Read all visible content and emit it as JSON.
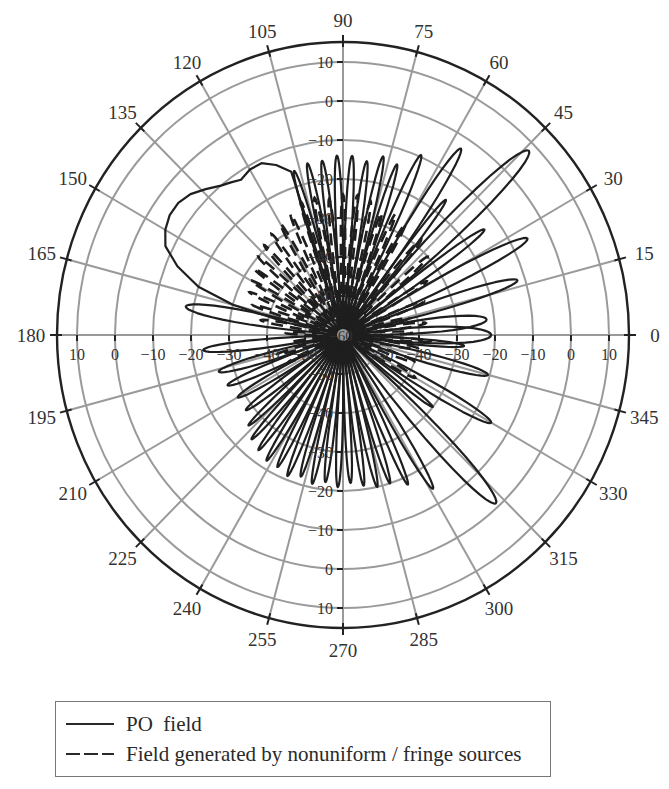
{
  "chart_data": {
    "type": "polar",
    "title": "",
    "angular_axis": {
      "unit": "deg",
      "ticks": [
        0,
        15,
        30,
        45,
        60,
        75,
        90,
        105,
        120,
        135,
        150,
        165,
        180,
        195,
        210,
        225,
        240,
        255,
        270,
        285,
        300,
        315,
        330,
        345
      ],
      "labels": [
        "0",
        "15",
        "30",
        "45",
        "60",
        "75",
        "90",
        "105",
        "120",
        "135",
        "150",
        "165",
        "180",
        "195",
        "210",
        "225",
        "240",
        "255",
        "270",
        "285",
        "300",
        "315",
        "330",
        "345"
      ]
    },
    "radial_axis": {
      "unit": "dB",
      "range": [
        -60,
        10
      ],
      "ticks": [
        -60,
        -50,
        -40,
        -30,
        -20,
        -10,
        0,
        10
      ],
      "labels": [
        "-60",
        "-50",
        "-40",
        "-30",
        "-20",
        "-10",
        "0",
        "10"
      ],
      "grid": true
    },
    "series": [
      {
        "name": "PO field",
        "style": "solid",
        "lobes_deg_peakdB_halfwidth": [
          [
            0,
            -21,
            7
          ],
          [
            6,
            -22,
            6
          ],
          [
            17,
            -12,
            4
          ],
          [
            27,
            -5.5,
            4
          ],
          [
            36,
            -14,
            3
          ],
          [
            44,
            8,
            5
          ],
          [
            52,
            -16,
            2.5
          ],
          [
            57,
            -3,
            3.5
          ],
          [
            66,
            -9.5,
            3
          ],
          [
            72,
            -14,
            2.5
          ],
          [
            77,
            -13,
            2.5
          ],
          [
            82,
            -15,
            2.5
          ],
          [
            87,
            -14,
            2.5
          ],
          [
            92,
            -14,
            2.5
          ],
          [
            97,
            -15,
            2.5
          ],
          [
            102,
            -15,
            2.5
          ],
          [
            107,
            -16,
            2.5
          ],
          [
            170,
            -18,
            5
          ],
          [
            186,
            -23,
            4
          ],
          [
            196,
            -26,
            4
          ],
          [
            203,
            -27,
            3.5
          ],
          [
            210,
            -28,
            3.5
          ],
          [
            217,
            -28,
            3
          ],
          [
            223,
            -26,
            2.5
          ],
          [
            228,
            -24,
            2.5
          ],
          [
            233,
            -23,
            2.5
          ],
          [
            238,
            -22,
            2.5
          ],
          [
            243,
            -22,
            2.5
          ],
          [
            248,
            -21,
            2.5
          ],
          [
            253,
            -22,
            2.5
          ],
          [
            258,
            -21,
            2.5
          ],
          [
            263,
            -22,
            2.5
          ],
          [
            268,
            -21,
            2.5
          ],
          [
            273,
            -22,
            2.5
          ],
          [
            278,
            -21,
            2.5
          ],
          [
            283,
            -20,
            2.5
          ],
          [
            288,
            -20,
            2.5
          ],
          [
            294,
            -18,
            2.5
          ],
          [
            301,
            -14,
            3
          ],
          [
            313,
            -1,
            5
          ],
          [
            322,
            -30,
            2.5
          ],
          [
            330,
            -15,
            4
          ],
          [
            345,
            -20.5,
            4
          ],
          [
            355,
            -28,
            3
          ]
        ],
        "broad_lobe_deg_dB": [
          [
            108,
            -16
          ],
          [
            112,
            -13
          ],
          [
            116,
            -11
          ],
          [
            120,
            -11
          ],
          [
            124,
            -12
          ],
          [
            127,
            -11
          ],
          [
            130,
            -10
          ],
          [
            134,
            -8
          ],
          [
            138,
            -6
          ],
          [
            142,
            -5
          ],
          [
            146,
            -5
          ],
          [
            150,
            -6
          ],
          [
            154,
            -8
          ],
          [
            158,
            -13
          ],
          [
            162,
            -20
          ],
          [
            165,
            -30
          ],
          [
            168,
            -45
          ]
        ]
      },
      {
        "name": "Field generated by nonuniform / fringe sources",
        "style": "dashed",
        "lobes_deg_peakdB_halfwidth": [
          [
            2,
            -42,
            3
          ],
          [
            8,
            -38,
            3
          ],
          [
            14,
            -42,
            3
          ],
          [
            22,
            -37,
            2.5
          ],
          [
            32,
            -34,
            2.5
          ],
          [
            42,
            -30,
            2.5
          ],
          [
            50,
            -28,
            2.5
          ],
          [
            60,
            -27,
            2
          ],
          [
            66,
            -26,
            2
          ],
          [
            72,
            -27,
            2
          ],
          [
            78,
            -25,
            2
          ],
          [
            84,
            -24,
            2
          ],
          [
            90,
            -24,
            2
          ],
          [
            96,
            -25,
            2
          ],
          [
            102,
            -24,
            2
          ],
          [
            108,
            -24,
            2
          ],
          [
            114,
            -26,
            2
          ],
          [
            120,
            -27,
            2
          ],
          [
            126,
            -28,
            2
          ],
          [
            132,
            -29,
            2
          ],
          [
            138,
            -30,
            2
          ],
          [
            144,
            -31,
            2
          ],
          [
            150,
            -32,
            2
          ],
          [
            156,
            -33,
            2
          ],
          [
            162,
            -35,
            2
          ],
          [
            170,
            -38,
            2.5
          ],
          [
            178,
            -45,
            2.5
          ],
          [
            188,
            -46,
            2.5
          ],
          [
            196,
            -42,
            2.5
          ],
          [
            206,
            -44,
            2.5
          ],
          [
            330,
            -38,
            3
          ],
          [
            340,
            -40,
            3
          ],
          [
            350,
            -40,
            3
          ],
          [
            356,
            -37,
            2
          ]
        ]
      }
    ],
    "legend": {
      "position": "bottom",
      "entries": [
        "PO field",
        "Field generated by nonuniform / fringe sources"
      ]
    }
  },
  "legend": {
    "entries": [
      {
        "label": "PO  field",
        "style": "solid"
      },
      {
        "label": "Field generated by nonuniform / fringe sources",
        "style": "dashed"
      }
    ]
  }
}
